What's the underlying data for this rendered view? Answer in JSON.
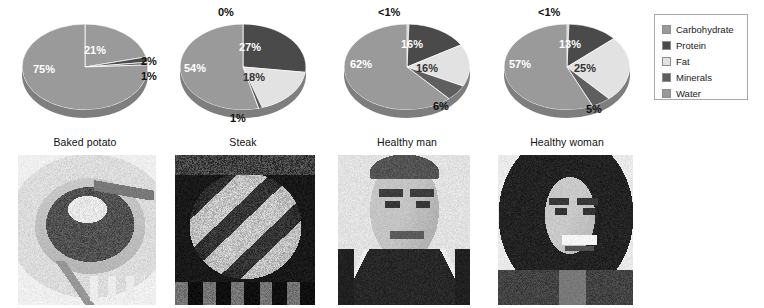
{
  "legend": {
    "items": [
      {
        "label": "Carbohydrate",
        "color": "#9a9a9a"
      },
      {
        "label": "Protein",
        "color": "#4a4a4a"
      },
      {
        "label": "Fat",
        "color": "#e2e2e2"
      },
      {
        "label": "Minerals",
        "color": "#5f5f5f"
      },
      {
        "label": "Water",
        "color": "#9a9a9a"
      }
    ]
  },
  "chart_data": {
    "type": "pie",
    "categories": [
      "Carbohydrate",
      "Protein",
      "Fat",
      "Minerals",
      "Water"
    ],
    "colors": [
      "#9a9a9a",
      "#4a4a4a",
      "#e2e2e2",
      "#5f5f5f",
      "#9a9a9a"
    ],
    "legend_position": "right",
    "charts": [
      {
        "name": "Baked potato",
        "label": "Baked potato",
        "values": [
          21,
          2,
          0,
          1,
          75
        ],
        "labels": [
          "21%",
          "2%",
          "",
          "1%",
          "75%"
        ]
      },
      {
        "name": "Steak",
        "label": "Steak",
        "values": [
          0,
          27,
          18,
          1,
          54
        ],
        "labels": [
          "0%",
          "27%",
          "18%",
          "1%",
          "54%"
        ]
      },
      {
        "name": "Healthy man",
        "label": "Healthy man",
        "values": [
          0.5,
          16,
          16,
          6,
          62
        ],
        "labels": [
          "<1%",
          "16%",
          "16%",
          "6%",
          "62%"
        ]
      },
      {
        "name": "Healthy woman",
        "label": "Healthy woman",
        "values": [
          0.5,
          13,
          25,
          5,
          57
        ],
        "labels": [
          "<1%",
          "13%",
          "25%",
          "5%",
          "57%"
        ]
      }
    ]
  },
  "photos": [
    {
      "name": "baked-potato-photo",
      "caption": "Baked potato",
      "subject": "baked potato on plate with fork"
    },
    {
      "name": "steak-photo",
      "caption": "Steak",
      "subject": "grilled steak on grill"
    },
    {
      "name": "healthy-man-photo",
      "caption": "Healthy man",
      "subject": "smiling young man portrait"
    },
    {
      "name": "healthy-woman-photo",
      "caption": "Healthy woman",
      "subject": "smiling young woman portrait"
    }
  ]
}
